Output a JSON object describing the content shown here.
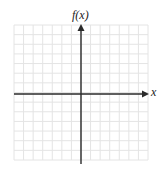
{
  "diagram": {
    "type": "coordinate-plane",
    "x_axis_label": "x",
    "y_axis_label": "f(x)",
    "grid": {
      "columns": 14,
      "rows": 14,
      "left": 14,
      "top": 25,
      "right": 148,
      "bottom": 160,
      "line_color": "#e4e4e4"
    },
    "axes": {
      "origin_x": 81,
      "origin_y": 94,
      "x_start": 14,
      "x_end": 149,
      "y_start": 164,
      "y_end": 24,
      "color": "#2a2a2a"
    }
  }
}
